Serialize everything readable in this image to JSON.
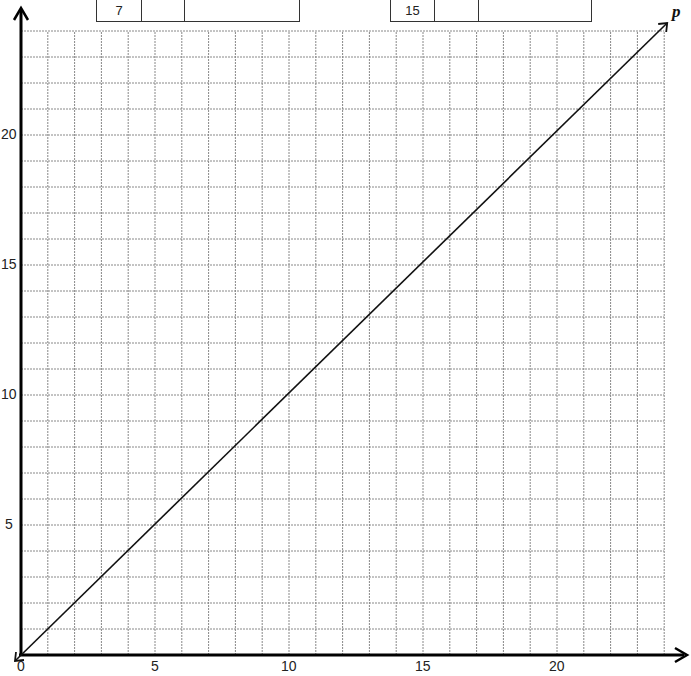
{
  "tables": [
    {
      "cells": [
        "7",
        "",
        ""
      ]
    },
    {
      "cells": [
        "15",
        "",
        ""
      ]
    }
  ],
  "axis_label_line": "p",
  "chart_data": {
    "type": "line",
    "title": "",
    "xlabel": "",
    "ylabel": "",
    "xlim": [
      0,
      24
    ],
    "ylim": [
      0,
      24
    ],
    "x_ticks": [
      "0",
      "5",
      "10",
      "15",
      "20"
    ],
    "y_ticks": [
      "5",
      "10",
      "15",
      "20"
    ],
    "grid": true,
    "series": [
      {
        "name": "p",
        "x": [
          0,
          24
        ],
        "y": [
          0,
          24
        ]
      }
    ]
  }
}
